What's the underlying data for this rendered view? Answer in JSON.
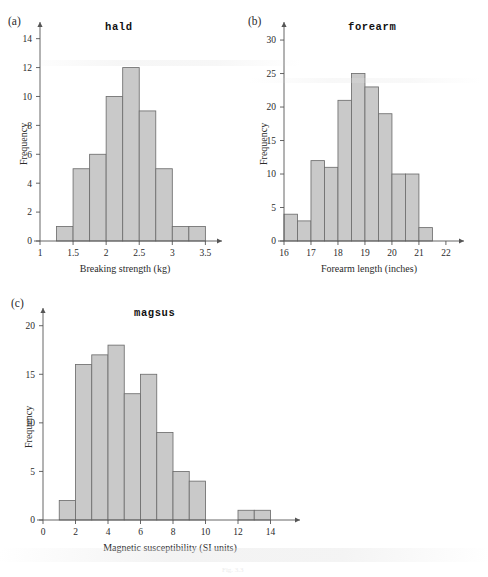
{
  "page": {
    "background": "#ffffff",
    "bar_fill": "#c9c9c9",
    "bar_stroke": "#6e6e6e",
    "axis_color": "#555555",
    "caption": "Fig. 3.3"
  },
  "panels": [
    {
      "key": "a",
      "label": "(a)",
      "title": "hald",
      "ylabel": "Frequency",
      "xlabel": "Breaking strength (kg)"
    },
    {
      "key": "b",
      "label": "(b)",
      "title": "forearm",
      "ylabel": "Frequency",
      "xlabel": "Forearm length (inches)"
    },
    {
      "key": "c",
      "label": "(c)",
      "title": "magsus",
      "ylabel": "Frequency",
      "xlabel": "Magnetic susceptibility (SI units)"
    }
  ],
  "chart_data": [
    {
      "type": "bar",
      "id": "hald",
      "title": "hald",
      "panel": "(a)",
      "xlabel": "Breaking strength (kg)",
      "ylabel": "Frequency",
      "xlim": [
        1,
        3.6
      ],
      "ylim": [
        0,
        14.6
      ],
      "xticks": [
        1,
        1.5,
        2,
        2.5,
        3,
        3.5
      ],
      "xticklabels": [
        "1",
        "1.5",
        "2",
        "2.5",
        "3",
        "3.5"
      ],
      "yticks": [
        0,
        2,
        4,
        6,
        8,
        10,
        12,
        14
      ],
      "yticklabels": [
        "0",
        "2",
        "4",
        "6",
        "8",
        "10",
        "12",
        "14"
      ],
      "bin_width": 0.25,
      "bin_edges": [
        1.25,
        1.5,
        1.75,
        2.0,
        2.25,
        2.5,
        2.75,
        3.0,
        3.25,
        3.5
      ],
      "values": [
        1,
        5,
        6,
        10,
        12,
        9,
        5,
        1,
        1
      ],
      "grid": false,
      "legend": null
    },
    {
      "type": "bar",
      "id": "forearm",
      "title": "forearm",
      "panel": "(b)",
      "xlabel": "Forearm length (inches)",
      "ylabel": "Frequency",
      "xlim": [
        16,
        22.3
      ],
      "ylim": [
        0,
        31.5
      ],
      "xticks": [
        16,
        17,
        18,
        19,
        20,
        21,
        22
      ],
      "xticklabels": [
        "16",
        "17",
        "18",
        "19",
        "20",
        "21",
        "22"
      ],
      "yticks": [
        0,
        5,
        10,
        15,
        20,
        25,
        30
      ],
      "yticklabels": [
        "0",
        "5",
        "10",
        "15",
        "20",
        "25",
        "30"
      ],
      "bin_width": 0.5,
      "bin_edges": [
        16.0,
        16.5,
        17.0,
        17.5,
        18.0,
        18.5,
        19.0,
        19.5,
        20.0,
        20.5,
        21.0,
        21.5
      ],
      "values": [
        4,
        3,
        12,
        11,
        21,
        25,
        23,
        19,
        10,
        10,
        2
      ],
      "grid": false,
      "legend": null
    },
    {
      "type": "bar",
      "id": "magsus",
      "title": "magsus",
      "panel": "(c)",
      "xlabel": "Magnetic susceptibility (SI units)",
      "ylabel": "Frequency",
      "xlim": [
        0,
        15.2
      ],
      "ylim": [
        0,
        21
      ],
      "xticks": [
        0,
        2,
        4,
        6,
        8,
        10,
        12,
        14
      ],
      "xticklabels": [
        "0",
        "2",
        "4",
        "6",
        "8",
        "10",
        "12",
        "14"
      ],
      "yticks": [
        0,
        5,
        10,
        15,
        20
      ],
      "yticklabels": [
        "0",
        "5",
        "10",
        "15",
        "20"
      ],
      "bin_width": 1,
      "bin_edges": [
        1,
        2,
        3,
        4,
        5,
        6,
        7,
        8,
        9,
        10,
        12,
        13,
        14
      ],
      "bars": [
        {
          "x0": 1,
          "x1": 2,
          "v": 2
        },
        {
          "x0": 2,
          "x1": 3,
          "v": 16
        },
        {
          "x0": 3,
          "x1": 4,
          "v": 17
        },
        {
          "x0": 4,
          "x1": 5,
          "v": 18
        },
        {
          "x0": 5,
          "x1": 6,
          "v": 13
        },
        {
          "x0": 6,
          "x1": 7,
          "v": 15
        },
        {
          "x0": 7,
          "x1": 8,
          "v": 9
        },
        {
          "x0": 8,
          "x1": 9,
          "v": 5
        },
        {
          "x0": 9,
          "x1": 10,
          "v": 4
        },
        {
          "x0": 12,
          "x1": 13,
          "v": 1
        },
        {
          "x0": 13,
          "x1": 14,
          "v": 1
        }
      ],
      "values": [
        2,
        16,
        17,
        18,
        13,
        15,
        9,
        5,
        4,
        1,
        1
      ],
      "grid": false,
      "legend": null
    }
  ]
}
